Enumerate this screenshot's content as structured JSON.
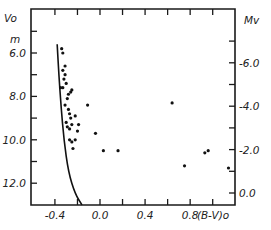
{
  "chart_data": {
    "type": "scatter",
    "title": "",
    "xlabel": "(B-V)o",
    "ylabel_left": "Vo",
    "ylabel_left_unit": "m",
    "ylabel_right": "Mv",
    "xlim": [
      -0.62,
      1.2
    ],
    "ylim_left": [
      13.0,
      4.9
    ],
    "ylim_right": [
      -0.5,
      -7.5
    ],
    "x_ticks": [
      -0.4,
      -0.2,
      0.0,
      0.2,
      0.4,
      0.6,
      0.8,
      1.0
    ],
    "x_tick_labels": [
      "-0.4",
      "",
      "0.0",
      "",
      "0.4",
      "",
      "0.8",
      ""
    ],
    "y_left_ticks": [
      5.0,
      6.0,
      7.0,
      8.0,
      9.0,
      10.0,
      11.0,
      12.0
    ],
    "y_left_tick_labels": [
      "",
      "6.0",
      "",
      "8.0",
      "",
      "10.0",
      "",
      "12.0"
    ],
    "y_right_ticks": [
      -7.0,
      -6.0,
      -5.0,
      -4.0,
      -3.0,
      -2.0,
      -1.0,
      0.0
    ],
    "y_right_tick_labels": [
      "",
      "-6.0",
      "",
      "-4.0",
      "",
      "-2.0",
      "",
      "0.0"
    ],
    "grid": false,
    "legend": null,
    "series": [
      {
        "name": "stars",
        "kind": "points",
        "points": [
          {
            "bv": -0.34,
            "v": 5.8
          },
          {
            "bv": -0.33,
            "v": 6.0
          },
          {
            "bv": -0.31,
            "v": 6.6
          },
          {
            "bv": -0.33,
            "v": 6.8
          },
          {
            "bv": -0.31,
            "v": 7.0
          },
          {
            "bv": -0.32,
            "v": 7.2
          },
          {
            "bv": -0.3,
            "v": 7.4
          },
          {
            "bv": -0.35,
            "v": 7.6
          },
          {
            "bv": -0.33,
            "v": 7.6
          },
          {
            "bv": -0.28,
            "v": 7.9
          },
          {
            "bv": -0.26,
            "v": 7.8
          },
          {
            "bv": -0.25,
            "v": 7.7
          },
          {
            "bv": -0.29,
            "v": 8.1
          },
          {
            "bv": -0.31,
            "v": 8.4
          },
          {
            "bv": -0.28,
            "v": 8.6
          },
          {
            "bv": -0.27,
            "v": 8.8
          },
          {
            "bv": -0.26,
            "v": 9.0
          },
          {
            "bv": -0.3,
            "v": 9.2
          },
          {
            "bv": -0.29,
            "v": 9.4
          },
          {
            "bv": -0.27,
            "v": 9.5
          },
          {
            "bv": -0.25,
            "v": 9.3
          },
          {
            "bv": -0.22,
            "v": 8.9
          },
          {
            "bv": -0.19,
            "v": 9.3
          },
          {
            "bv": -0.2,
            "v": 9.6
          },
          {
            "bv": -0.27,
            "v": 10.0
          },
          {
            "bv": -0.25,
            "v": 10.1
          },
          {
            "bv": -0.22,
            "v": 10.0
          },
          {
            "bv": -0.24,
            "v": 10.4
          },
          {
            "bv": -0.11,
            "v": 8.4
          },
          {
            "bv": -0.04,
            "v": 9.7
          },
          {
            "bv": 0.03,
            "v": 10.5
          },
          {
            "bv": 0.16,
            "v": 10.5
          },
          {
            "bv": 0.64,
            "v": 8.3
          },
          {
            "bv": 0.75,
            "v": 11.2
          },
          {
            "bv": 0.93,
            "v": 10.6
          },
          {
            "bv": 0.96,
            "v": 10.5
          },
          {
            "bv": 1.14,
            "v": 11.3
          }
        ]
      },
      {
        "name": "ZAMS",
        "kind": "curve",
        "points": [
          {
            "bv": -0.38,
            "v": 5.6
          },
          {
            "bv": -0.365,
            "v": 7.0
          },
          {
            "bv": -0.345,
            "v": 8.5
          },
          {
            "bv": -0.32,
            "v": 10.0
          },
          {
            "bv": -0.28,
            "v": 11.5
          },
          {
            "bv": -0.22,
            "v": 12.5
          },
          {
            "bv": -0.16,
            "v": 13.0
          }
        ]
      }
    ]
  }
}
